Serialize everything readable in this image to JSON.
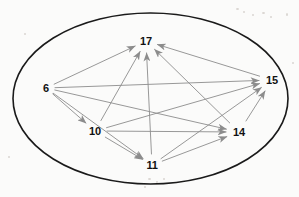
{
  "diagram": {
    "type": "directed-graph",
    "canvas": {
      "width": 299,
      "height": 197,
      "background": "#fbfbfa"
    },
    "boundary": {
      "shape": "ellipse",
      "cx": 150.5,
      "cy": 98.5,
      "rx": 137.5,
      "ry": 85.5,
      "stroke": "#1a1a1a",
      "stroke_width": 1.6,
      "fill": "none"
    },
    "style": {
      "edge_color": "#8c8c8c",
      "edge_width": 0.9,
      "arrow_color": "#8c8c8c",
      "label_color": "#111111",
      "label_font_size": 11
    },
    "nodes": [
      {
        "id": "n6",
        "label": "6",
        "x": 46,
        "y": 88,
        "lx": 46,
        "ly": 88
      },
      {
        "id": "n17",
        "label": "17",
        "x": 146,
        "y": 41,
        "lx": 146,
        "ly": 41
      },
      {
        "id": "n15",
        "label": "15",
        "x": 272,
        "y": 80,
        "lx": 272,
        "ly": 80
      },
      {
        "id": "n14",
        "label": "14",
        "x": 239,
        "y": 132,
        "lx": 239,
        "ly": 132
      },
      {
        "id": "n10",
        "label": "10",
        "x": 95,
        "y": 131,
        "lx": 95,
        "ly": 131
      },
      {
        "id": "n11",
        "label": "11",
        "x": 152,
        "y": 165,
        "lx": 152,
        "ly": 165
      }
    ],
    "edges": [
      {
        "id": "e1",
        "from": "n6",
        "to": "n17",
        "directed": true
      },
      {
        "id": "e2",
        "from": "n6",
        "to": "n15",
        "directed": true
      },
      {
        "id": "e3",
        "from": "n6",
        "to": "n14",
        "directed": true
      },
      {
        "id": "e4",
        "from": "n6",
        "to": "n10",
        "directed": true
      },
      {
        "id": "e5",
        "from": "n6",
        "to": "n11",
        "directed": true
      },
      {
        "id": "e6",
        "from": "n10",
        "to": "n17",
        "directed": true
      },
      {
        "id": "e7",
        "from": "n10",
        "to": "n15",
        "directed": true
      },
      {
        "id": "e8",
        "from": "n10",
        "to": "n14",
        "directed": true
      },
      {
        "id": "e9",
        "from": "n10",
        "to": "n11",
        "directed": true
      },
      {
        "id": "e10",
        "from": "n11",
        "to": "n17",
        "directed": true
      },
      {
        "id": "e11",
        "from": "n11",
        "to": "n15",
        "directed": true
      },
      {
        "id": "e12",
        "from": "n11",
        "to": "n14",
        "directed": true
      },
      {
        "id": "e13",
        "from": "n14",
        "to": "n17",
        "directed": true
      },
      {
        "id": "e14",
        "from": "n14",
        "to": "n15",
        "directed": true
      },
      {
        "id": "e15",
        "from": "n15",
        "to": "n17",
        "directed": true
      }
    ],
    "specks": [
      {
        "x": 236,
        "y": 8,
        "w": 3,
        "h": 2
      },
      {
        "x": 243,
        "y": 11,
        "w": 2,
        "h": 2
      },
      {
        "x": 252,
        "y": 14,
        "w": 2,
        "h": 2
      },
      {
        "x": 262,
        "y": 12,
        "w": 3,
        "h": 2
      },
      {
        "x": 270,
        "y": 16,
        "w": 2,
        "h": 2
      },
      {
        "x": 286,
        "y": 13,
        "w": 2,
        "h": 3
      },
      {
        "x": 24,
        "y": 33,
        "w": 2,
        "h": 2
      },
      {
        "x": 148,
        "y": 178,
        "w": 3,
        "h": 2
      },
      {
        "x": 156,
        "y": 181,
        "w": 2,
        "h": 2
      },
      {
        "x": 163,
        "y": 178,
        "w": 2,
        "h": 2
      },
      {
        "x": 144,
        "y": 186,
        "w": 2,
        "h": 2
      },
      {
        "x": 292,
        "y": 62,
        "w": 2,
        "h": 2
      },
      {
        "x": 8,
        "y": 156,
        "w": 2,
        "h": 2
      }
    ]
  }
}
